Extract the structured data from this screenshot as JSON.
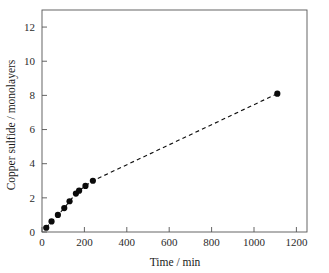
{
  "chart_data": {
    "type": "scatter",
    "title": "",
    "xlabel": "Time / min",
    "ylabel": "Copper sulfide / monolayers",
    "xlim": [
      0,
      1250
    ],
    "ylim": [
      0,
      13
    ],
    "xticks": [
      0,
      200,
      400,
      600,
      800,
      1000,
      1200
    ],
    "yticks": [
      0,
      2,
      4,
      6,
      8,
      10,
      12
    ],
    "xtick_labels": [
      "0",
      "200",
      "400",
      "600",
      "800",
      "1000",
      "1200"
    ],
    "ytick_labels": [
      "0",
      "2",
      "4",
      "6",
      "8",
      "10",
      "12"
    ],
    "grid": false,
    "legend": null,
    "series": [
      {
        "name": "Copper sulfide growth",
        "marker": "filled-circle",
        "marker_color": "#0b0b0b",
        "line_style": "dashed",
        "line_color": "#111111",
        "x": [
          20,
          45,
          75,
          105,
          130,
          160,
          175,
          205,
          240,
          1110
        ],
        "y": [
          0.25,
          0.62,
          1.0,
          1.4,
          1.8,
          2.25,
          2.42,
          2.7,
          3.0,
          8.1
        ]
      }
    ],
    "annotations": []
  },
  "axes": {
    "x_axis_name": "time-axis",
    "y_axis_name": "monolayers-axis"
  }
}
